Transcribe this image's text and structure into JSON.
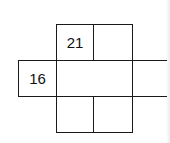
{
  "diagram": {
    "type": "net-grid",
    "cells": [
      {
        "id": "top-left",
        "value": "21"
      },
      {
        "id": "top-right",
        "value": ""
      },
      {
        "id": "middle-left",
        "value": "16"
      },
      {
        "id": "middle-center",
        "value": ""
      },
      {
        "id": "middle-right",
        "value": ""
      },
      {
        "id": "bottom-left",
        "value": ""
      },
      {
        "id": "bottom-right",
        "value": ""
      }
    ]
  }
}
